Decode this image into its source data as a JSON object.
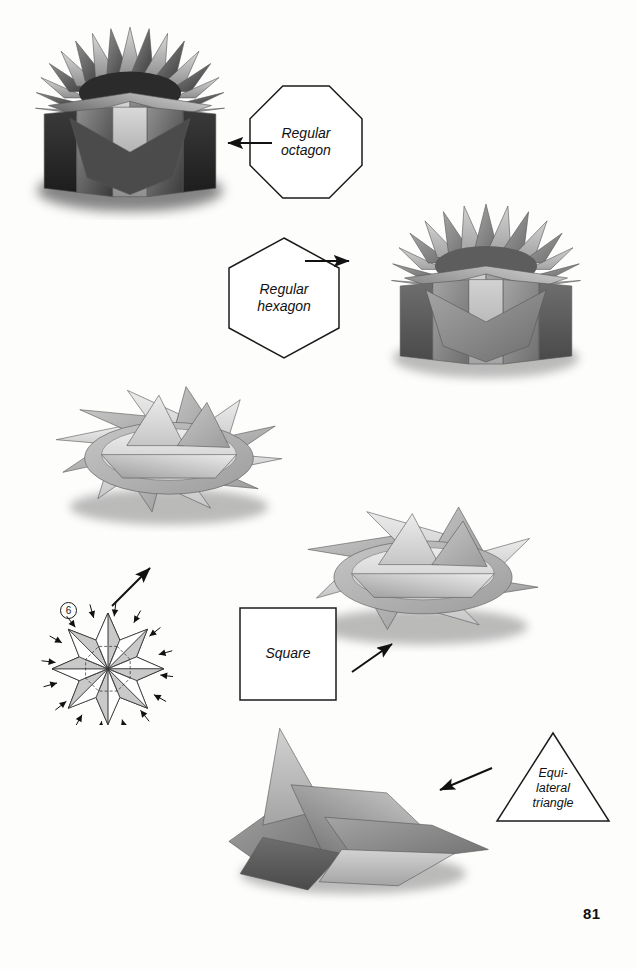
{
  "page": {
    "number": "81",
    "background": "#fdfdfc",
    "ink": "#111111",
    "width": 637,
    "height": 969
  },
  "shapes": [
    {
      "id": "octagon",
      "name": "regular-octagon",
      "label_line1": "Regular",
      "label_line2": "octagon",
      "geometry": "octagon",
      "x": 250,
      "y": 86,
      "w": 112,
      "h": 112
    },
    {
      "id": "hexagon",
      "name": "regular-hexagon",
      "label_line1": "Regular",
      "label_line2": "hexagon",
      "geometry": "hexagon",
      "x": 229,
      "y": 238,
      "w": 110,
      "h": 120
    },
    {
      "id": "square",
      "name": "square",
      "label_line1": "Square",
      "label_line2": "",
      "geometry": "square",
      "x": 240,
      "y": 608,
      "w": 96,
      "h": 92
    },
    {
      "id": "triangle",
      "name": "equilateral-triangle",
      "label_line1": "Equi-",
      "label_line2": "lateral",
      "label_line3": "triangle",
      "geometry": "triangle",
      "x": 497,
      "y": 733,
      "w": 112,
      "h": 88
    }
  ],
  "arrows": [
    {
      "id": "arrow-to-octagon-box",
      "points_to": "octagon-star-box-photo",
      "direction": "left",
      "x1": 272,
      "y1": 143,
      "x2": 228,
      "y2": 143
    },
    {
      "id": "arrow-to-hexagon-box",
      "points_to": "hexagon-star-box-photo",
      "direction": "right",
      "x1": 305,
      "y1": 261,
      "x2": 349,
      "y2": 261
    },
    {
      "id": "arrow-to-square-box",
      "points_to": "square-star-box-photo",
      "direction": "up-right",
      "x1": 352,
      "y1": 672,
      "x2": 392,
      "y2": 644
    },
    {
      "id": "arrow-to-triangle-box",
      "points_to": "triangle-star-box-photo",
      "direction": "down-left",
      "x1": 492,
      "y1": 768,
      "x2": 440,
      "y2": 790
    },
    {
      "id": "arrow-from-step-diagram",
      "points_to": "hexagon-star-bowl-photo",
      "direction": "up-right",
      "x1": 112,
      "y1": 606,
      "x2": 150,
      "y2": 568
    }
  ],
  "diagram": {
    "id": "step-6-diagram",
    "step_number": "6",
    "caption": "",
    "x": 18,
    "y": 600,
    "w": 155,
    "h": 125
  },
  "photos": [
    {
      "id": "octagon-star-box-photo",
      "name": "octagon-star-box-photo",
      "shape": "octagon",
      "tone": "dark",
      "x": 14,
      "y": 8,
      "w": 232,
      "h": 212
    },
    {
      "id": "hexagon-star-box-photo",
      "name": "hexagon-star-box-photo",
      "shape": "hexagon",
      "tone": "mid",
      "x": 370,
      "y": 186,
      "w": 232,
      "h": 200
    },
    {
      "id": "hexagon-star-bowl-photo",
      "name": "hexagon-star-bowl-photo",
      "shape": "hexagon",
      "tone": "light",
      "x": 45,
      "y": 352,
      "w": 248,
      "h": 180
    },
    {
      "id": "square-star-box-photo",
      "name": "square-star-box-photo",
      "shape": "square",
      "tone": "light",
      "x": 292,
      "y": 470,
      "w": 262,
      "h": 182
    },
    {
      "id": "triangle-star-box-photo",
      "name": "triangle-star-box-photo",
      "shape": "triangle",
      "tone": "mid",
      "x": 212,
      "y": 700,
      "w": 282,
      "h": 202
    }
  ]
}
